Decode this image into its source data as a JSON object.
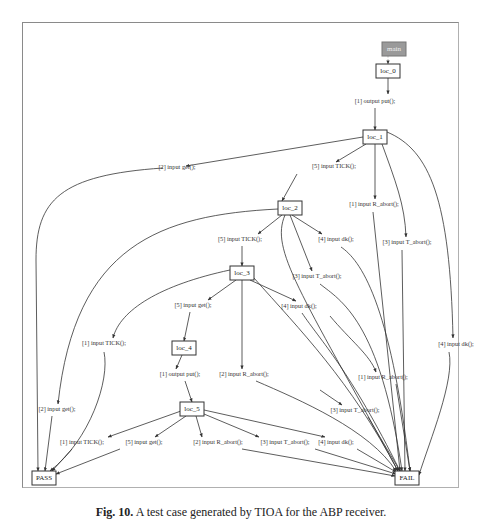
{
  "figure": {
    "caption_label": "Fig. 10.",
    "caption_text": "A test case generated by TIOA for the ABP receiver."
  },
  "nodes": [
    {
      "id": "main",
      "label": "main",
      "x": 382,
      "y": 42,
      "w": 24,
      "h": 14,
      "kind": "start"
    },
    {
      "id": "loc_0",
      "label": "loc_0",
      "x": 376,
      "y": 64,
      "w": 24,
      "h": 14,
      "kind": "state"
    },
    {
      "id": "loc_1",
      "label": "loc_1",
      "x": 363,
      "y": 130,
      "w": 24,
      "h": 14,
      "kind": "state"
    },
    {
      "id": "loc_2",
      "label": "loc_2",
      "x": 278,
      "y": 201,
      "w": 24,
      "h": 14,
      "kind": "state"
    },
    {
      "id": "loc_3",
      "label": "loc_3",
      "x": 230,
      "y": 266,
      "w": 24,
      "h": 14,
      "kind": "state"
    },
    {
      "id": "loc_4",
      "label": "loc_4",
      "x": 172,
      "y": 341,
      "w": 24,
      "h": 14,
      "kind": "state"
    },
    {
      "id": "loc_5",
      "label": "loc_5",
      "x": 180,
      "y": 402,
      "w": 24,
      "h": 14,
      "kind": "state"
    },
    {
      "id": "PASS",
      "label": "PASS",
      "x": 32,
      "y": 471,
      "w": 24,
      "h": 14,
      "kind": "verdict"
    },
    {
      "id": "FAL",
      "label": "FAIL",
      "x": 395,
      "y": 471,
      "w": 24,
      "h": 14,
      "kind": "verdict"
    }
  ],
  "edges": [
    {
      "label": "",
      "lx": 0,
      "ly": 0,
      "path": "M388,56 L388,64",
      "style": "dashed"
    },
    {
      "label": "[1] output put();",
      "lx": 375,
      "ly": 102,
      "path": "M388,78 L388,94",
      "path2": "M375,108 L375,130"
    },
    {
      "label": "[2] input get();",
      "lx": 177,
      "ly": 168,
      "path": "M363,137 L186,166",
      "path2": "M163,168 C60,175 36,200 36,260 L38,471"
    },
    {
      "label": "[5] input TICK();",
      "lx": 334,
      "ly": 167,
      "path": "M366,144 L336,162",
      "path2": "M297,174 L282,201"
    },
    {
      "label": "[1] input R_abort();",
      "lx": 374,
      "ly": 205,
      "path": "M375,144 L375,199",
      "path2": "M373,212 L400,471"
    },
    {
      "label": "[3] input T_abort();",
      "lx": 407,
      "ly": 243,
      "path": "M382,144 C395,180 405,205 406,237",
      "path2": "M402,250 L405,471"
    },
    {
      "label": "[4] input dk();",
      "lx": 456,
      "ly": 345,
      "path": "M387,132 C430,150 450,200 453,338",
      "path2": "M449,352 C455,380 430,440 419,475"
    },
    {
      "label": "[2] input get();",
      "lx": 57,
      "ly": 410,
      "path": "M278,209 C160,215 75,245 58,404",
      "path2": "M52,416 L45,471"
    },
    {
      "label": "[5] input TICK();",
      "lx": 240,
      "ly": 240,
      "path": "M282,215 L258,234",
      "path2": "M242,246 L242,266"
    },
    {
      "label": "[4] input dk();",
      "lx": 336,
      "ly": 240,
      "path": "M292,215 L322,234",
      "path2": "M341,247 C360,260 390,300 410,471"
    },
    {
      "label": "[3] input T_abort();",
      "lx": 317,
      "ly": 277,
      "path": "M290,215 L312,271",
      "path2": "M320,284 C340,300 380,320 402,471"
    },
    {
      "label": "",
      "lx": 0,
      "ly": 0,
      "path": "M285,215 C270,250 300,290 398,471"
    },
    {
      "label": "[1] input TICK();",
      "lx": 104,
      "ly": 344,
      "path": "M230,270 C160,285 120,310 113,338",
      "path2": "M104,352 C110,380 90,440 50,471"
    },
    {
      "label": "[5] input get();",
      "lx": 193,
      "ly": 306,
      "path": "M236,280 L208,300",
      "path2": "M190,312 L184,341"
    },
    {
      "label": "[2] input R_abort();",
      "lx": 244,
      "ly": 375,
      "path": "M242,280 L242,369",
      "path2": "M256,381 C300,400 370,430 396,471"
    },
    {
      "label": "[4] input dk();",
      "lx": 299,
      "ly": 307,
      "path": "M250,280 L296,301",
      "path2": "M302,313 C320,340 350,370 400,471"
    },
    {
      "label": "",
      "lx": 0,
      "ly": 0,
      "path": "M254,278 C300,330 350,380 398,471"
    },
    {
      "label": "[1] input R_abort();",
      "lx": 383,
      "ly": 378,
      "path": "M330,316 C350,340 370,355 376,372",
      "path2": "M396,384 L410,471"
    },
    {
      "label": "[3] input T_abort();",
      "lx": 355,
      "ly": 411,
      "path": "M320,390 L342,405",
      "path2": "M368,417 L400,471"
    },
    {
      "label": "[1] output put();",
      "lx": 180,
      "ly": 375,
      "path": "M182,355 L176,369",
      "path2": "M185,381 L192,402"
    },
    {
      "label": "[1] input TICK();",
      "lx": 82,
      "ly": 443,
      "path": "M181,411 L108,437",
      "path2": "M72,449 L52,471"
    },
    {
      "label": "[5] input get();",
      "lx": 144,
      "ly": 443,
      "path": "M186,416 L155,437",
      "path2": "M120,449 L56,474"
    },
    {
      "label": "[2] input R_abort();",
      "lx": 218,
      "ly": 443,
      "path": "M196,416 L202,437",
      "path2": "M242,449 L395,476"
    },
    {
      "label": "[3] input T_abort();",
      "lx": 285,
      "ly": 443,
      "path": "M204,414 L259,437",
      "path2": "M315,449 L396,474"
    },
    {
      "label": "[4] input dk();",
      "lx": 336,
      "ly": 443,
      "path": "M204,410 L325,437",
      "path2": "M357,449 L396,472"
    }
  ]
}
